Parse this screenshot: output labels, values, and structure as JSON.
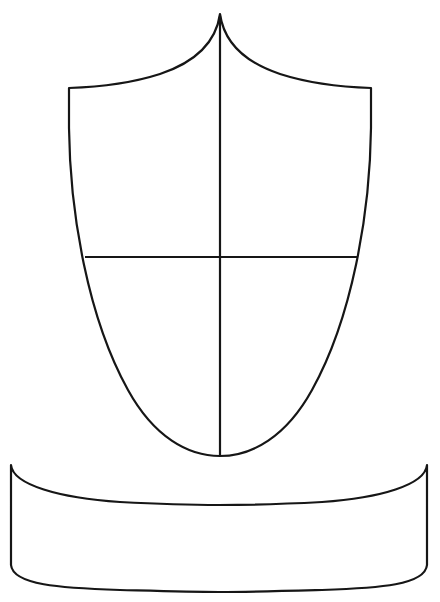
{
  "document": {
    "title": "Blank Heraldic Shield And Banner Outline",
    "kind": "line-art-template",
    "background_color": "#ffffff",
    "stroke_color": "#161616",
    "stroke_width_px": 2.2,
    "fill": "none",
    "canvas": {
      "width": 440,
      "height": 602
    }
  },
  "figure": {
    "name": "coat-of-arms-blank-template",
    "element_count": 4,
    "colors_used": [
      "#ffffff",
      "#161616"
    ]
  },
  "shapes": {
    "shield": {
      "label": "shield-escutcheon",
      "description": "Pointed-top heraldic shield with concave chief curves meeting at a central cusp, straight upper flanks, and sides curving to a rounded base point.",
      "apex": {
        "x": 220,
        "y": 14
      },
      "left_shoulder": {
        "x": 69,
        "y": 88
      },
      "right_shoulder": {
        "x": 371,
        "y": 88
      },
      "base_point": {
        "x": 220,
        "y": 456
      },
      "path": "M 220 14 C 216 42 196 62 160 74 C 132 83 100 87 69 88 L 69 128 C 70 214 88 318 128 390 C 154 437 188 456 220 456 C 252 456 286 437 312 390 C 352 318 370 214 371 128 L 371 88 C 340 87 308 83 280 74 C 244 62 224 42 220 14 Z"
    },
    "pale_line": {
      "label": "vertical-pale-divider",
      "description": "Vertical line splitting the shield from apex to base point.",
      "x1": 220,
      "y1": 16,
      "x2": 220,
      "y2": 456
    },
    "fess_line": {
      "label": "horizontal-fess-divider",
      "description": "Horizontal line crossing the shield, forming a quartered cross.",
      "x1": 85,
      "y1": 257,
      "x2": 357,
      "y2": 257
    },
    "banner": {
      "label": "banner-scroll-ribbon",
      "description": "Wide ribbon banner below the shield with downward-sagging top and bottom edges and slightly bowed vertical sides.",
      "top_left": {
        "x": 11,
        "y": 465
      },
      "top_right": {
        "x": 427,
        "y": 465
      },
      "bottom_left": {
        "x": 11,
        "y": 565
      },
      "bottom_right": {
        "x": 427,
        "y": 565
      },
      "top_sag_center": {
        "x": 219,
        "y": 504
      },
      "bottom_sag_center": {
        "x": 219,
        "y": 592
      },
      "path": "M 11 465 C 13 485 60 498 120 502 C 158 504 190 505 219 505 C 250 505 285 504 322 502 C 380 498 425 485 427 465 L 427 565 C 425 585 380 588 322 590 C 285 591 250 592 219 592 C 190 592 158 591 120 590 C 60 588 13 585 11 565 Z"
    }
  },
  "quarters": [
    {
      "label": "quarter-top-left"
    },
    {
      "label": "quarter-top-right"
    },
    {
      "label": "quarter-bottom-left"
    },
    {
      "label": "quarter-bottom-right"
    }
  ]
}
